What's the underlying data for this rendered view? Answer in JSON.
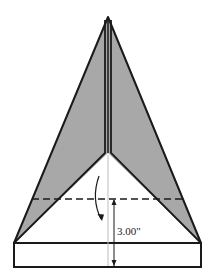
{
  "diagram": {
    "measurement": {
      "label": "3.00\"",
      "value": 3.0,
      "unit": "inches"
    },
    "fold_line": {
      "style": "dashed",
      "direction": "fold tip down"
    },
    "colors": {
      "shaded": "#a8a8a8",
      "outline": "#1a1a1a",
      "paper": "#ffffff",
      "center_line": "#bdbdbd"
    }
  }
}
